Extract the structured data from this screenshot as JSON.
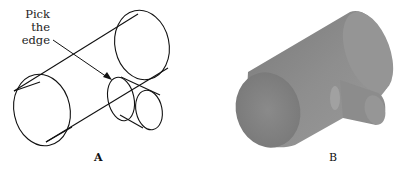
{
  "figure_a": {
    "callout_line1": "Pick the",
    "callout_line2": "edge",
    "label": "A",
    "style": "wireframe"
  },
  "figure_b": {
    "label": "B",
    "style": "shaded solid",
    "fill_color": "#8a8a8a"
  }
}
